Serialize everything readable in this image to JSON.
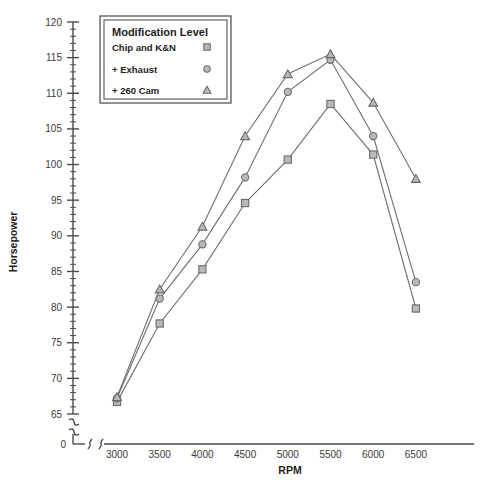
{
  "chart_data": {
    "type": "line",
    "title": "",
    "xlabel": "RPM",
    "ylabel": "Horsepower",
    "x": [
      3000,
      3500,
      4000,
      4500,
      5000,
      5500,
      6000,
      6500
    ],
    "xtick_labels": [
      "0",
      "3000",
      "3500",
      "4000",
      "4500",
      "5000",
      "5500",
      "6000",
      "6500"
    ],
    "ytick_labels": [
      "0",
      "65",
      "70",
      "75",
      "80",
      "85",
      "90",
      "95",
      "100",
      "105",
      "110",
      "115",
      "120"
    ],
    "xlim": [
      3000,
      6500
    ],
    "ylim": [
      65,
      120
    ],
    "ymajor_step": 5,
    "yminor_step": 1,
    "grid": false,
    "axis_break_x": true,
    "axis_break_y": true,
    "legend_position": "top-left",
    "legend_title": "Modification Level",
    "series": [
      {
        "name": "Chip and K&N",
        "marker": "square",
        "values": [
          66.7,
          77.7,
          85.3,
          94.6,
          100.7,
          108.5,
          101.4,
          79.8
        ]
      },
      {
        "name": "+ Exhaust",
        "marker": "circle",
        "values": [
          67.2,
          81.2,
          88.8,
          98.2,
          110.2,
          114.7,
          104.0,
          83.5
        ]
      },
      {
        "name": "+ 260 Cam",
        "marker": "triangle",
        "values": [
          67.4,
          82.5,
          91.3,
          104.0,
          112.7,
          115.5,
          108.7,
          98.0
        ]
      }
    ]
  },
  "colors": {
    "line": "#6e6e6e",
    "marker_stroke": "#6b6b6b",
    "marker_fill": "#b9b9b9",
    "axis": "#4a4a4a",
    "text": "#1d1d1d",
    "tick_text": "#3a3a3a",
    "background": "#ffffff"
  }
}
